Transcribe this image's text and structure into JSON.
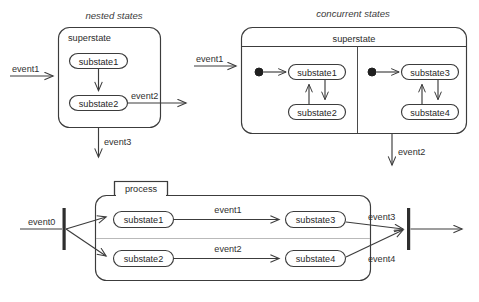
{
  "diagram": {
    "kind": "uml-state-diagram",
    "colors": {
      "stroke": "#3c3c3c",
      "faint_stroke": "#b9b9b9",
      "fill": "#ffffff",
      "text": "#2b2b2b",
      "bar": "#2e2e2e",
      "background": "#ffffff"
    },
    "captions": {
      "nested": "nested states",
      "concurrent": "concurrent states"
    },
    "nested_panel": {
      "superstate_title": "superstate",
      "substates": [
        {
          "label": "substate1"
        },
        {
          "label": "substate2"
        }
      ],
      "events": {
        "incoming": "event1",
        "side_exit": "event2",
        "bottom_exit": "event3"
      }
    },
    "concurrent_panel": {
      "superstate_title": "superstate",
      "regions": [
        {
          "substates": [
            {
              "label": "substate1"
            },
            {
              "label": "substate2"
            }
          ]
        },
        {
          "substates": [
            {
              "label": "substate3"
            },
            {
              "label": "substate4"
            }
          ]
        }
      ],
      "events": {
        "incoming": "event1",
        "bottom_exit": "event2"
      }
    },
    "process_panel": {
      "tab_title": "process",
      "substates": [
        {
          "label": "substate1"
        },
        {
          "label": "substate2"
        },
        {
          "label": "substate3"
        },
        {
          "label": "substate4"
        }
      ],
      "events": {
        "incoming": "event0",
        "top_transition": "event1",
        "bottom_transition": "event2",
        "top_join": "event3",
        "bottom_join": "event4"
      }
    }
  }
}
